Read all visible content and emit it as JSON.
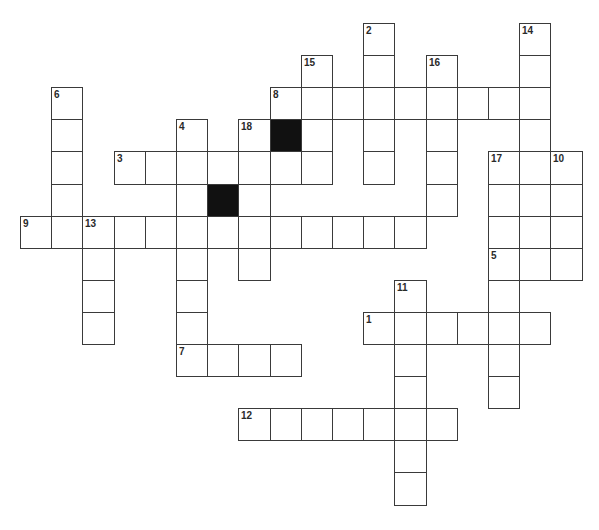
{
  "puzzle": {
    "layout": {
      "origin_x": 20,
      "origin_y": 23,
      "cell_w": 31.2,
      "cell_h": 32.1
    },
    "colors": {
      "line": "#3a3a3a",
      "block": "#111111",
      "number": "#2a2a2a",
      "background": "#ffffff"
    },
    "black_cells": [
      {
        "r": 3,
        "c": 8
      },
      {
        "r": 5,
        "c": 6
      }
    ],
    "entries": [
      {
        "number": "1",
        "direction": "across",
        "r": 9,
        "c": 11,
        "length": 6
      },
      {
        "number": "2",
        "direction": "down",
        "r": 0,
        "c": 11,
        "length": 5
      },
      {
        "number": "3",
        "direction": "across",
        "r": 4,
        "c": 3,
        "length": 7
      },
      {
        "number": "4",
        "direction": "down",
        "r": 3,
        "c": 5,
        "length": 8
      },
      {
        "number": "5",
        "direction": "across",
        "r": 7,
        "c": 15,
        "length": 3
      },
      {
        "number": "6",
        "direction": "down",
        "r": 2,
        "c": 1,
        "length": 5
      },
      {
        "number": "7",
        "direction": "across",
        "r": 10,
        "c": 5,
        "length": 4
      },
      {
        "number": "8",
        "direction": "across",
        "r": 2,
        "c": 8,
        "length": 9
      },
      {
        "number": "9",
        "direction": "across",
        "r": 6,
        "c": 0,
        "length": 13
      },
      {
        "number": "10",
        "direction": "down",
        "r": 4,
        "c": 17,
        "length": 4
      },
      {
        "number": "11",
        "direction": "down",
        "r": 8,
        "c": 12,
        "length": 7
      },
      {
        "number": "12",
        "direction": "across",
        "r": 12,
        "c": 7,
        "length": 7
      },
      {
        "number": "13",
        "direction": "down",
        "r": 6,
        "c": 2,
        "length": 4
      },
      {
        "number": "14",
        "direction": "down",
        "r": 0,
        "c": 16,
        "length": 8
      },
      {
        "number": "15",
        "direction": "down",
        "r": 1,
        "c": 9,
        "length": 4
      },
      {
        "number": "16",
        "direction": "down",
        "r": 1,
        "c": 13,
        "length": 5
      },
      {
        "number": "17",
        "direction": "down",
        "r": 4,
        "c": 15,
        "length": 8
      },
      {
        "number": "18",
        "direction": "down",
        "r": 3,
        "c": 7,
        "length": 5
      }
    ]
  }
}
